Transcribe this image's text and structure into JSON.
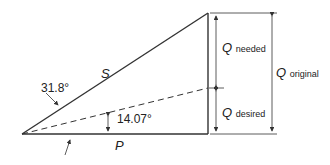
{
  "diagram": {
    "type": "power-triangle",
    "angles": {
      "original": "31.8°",
      "desired": "14.07°"
    },
    "sides": {
      "apparent": "S",
      "real": "P"
    },
    "q_labels": {
      "needed": {
        "symbol": "Q",
        "sub": "needed"
      },
      "desired": {
        "symbol": "Q",
        "sub": "desired"
      },
      "original": {
        "symbol": "Q",
        "sub": "original"
      }
    },
    "colors": {
      "line": "#333333",
      "background": "#ffffff"
    }
  }
}
